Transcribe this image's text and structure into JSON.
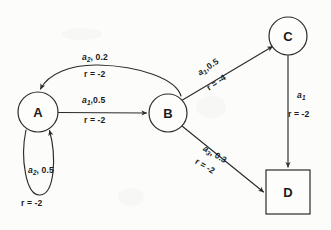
{
  "diagram": {
    "background_color": "#fcfcfb",
    "stroke_color": "#2b2b2b",
    "text_color": "#1b1b1b",
    "nodes": [
      {
        "id": "A",
        "label": "A",
        "shape": "circle",
        "cx": 38,
        "cy": 112,
        "r": 20
      },
      {
        "id": "B",
        "label": "B",
        "shape": "circle",
        "cx": 168,
        "cy": 113,
        "r": 19
      },
      {
        "id": "C",
        "label": "C",
        "shape": "circle",
        "cx": 288,
        "cy": 36,
        "r": 19
      },
      {
        "id": "D",
        "label": "D",
        "shape": "square",
        "x": 266,
        "y": 170,
        "w": 44,
        "h": 44
      }
    ],
    "edges": [
      {
        "id": "b-to-a",
        "from": "B",
        "to": "A",
        "action": "a",
        "action_sub": "2",
        "probability": "0.2",
        "action_prob_label": "a2, 0.2",
        "reward_label": "r = -2",
        "orientation": "horizontal"
      },
      {
        "id": "a-to-b",
        "from": "A",
        "to": "B",
        "action": "a",
        "action_sub": "1",
        "probability": "0.5",
        "action_prob_label": "a1,0.5",
        "reward_label": "r = -2",
        "orientation": "horizontal"
      },
      {
        "id": "a-self-loop",
        "from": "A",
        "to": "A",
        "action": "a",
        "action_sub": "2",
        "probability": "0.5",
        "action_prob_label": "a2, 0.5",
        "reward_label": "r = -2",
        "orientation": "horizontal"
      },
      {
        "id": "b-to-c",
        "from": "B",
        "to": "C",
        "action": "a",
        "action_sub": "1",
        "probability": "0.5",
        "action_prob_label": "a1,0.5",
        "reward_label": "r = -4",
        "orientation": "rotated-up"
      },
      {
        "id": "b-to-d",
        "from": "B",
        "to": "D",
        "action": "a",
        "action_sub": "3",
        "probability": "0.3",
        "action_prob_label": "a3, 0.3",
        "reward_label": "r = -2",
        "orientation": "rotated-down"
      },
      {
        "id": "c-to-d",
        "from": "C",
        "to": "D",
        "action": "a",
        "action_sub": "1",
        "probability": "",
        "action_prob_label": "a1",
        "reward_label": "r = -2",
        "orientation": "vertical"
      }
    ]
  }
}
